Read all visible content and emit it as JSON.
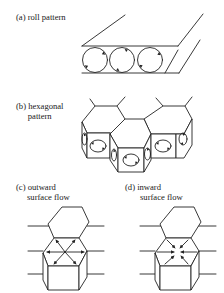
{
  "figure": {
    "panels": [
      {
        "id": "a",
        "label_line1": "(a) roll pattern",
        "label_line2": ""
      },
      {
        "id": "b",
        "label_line1": "(b) hexagonal",
        "label_line2": "pattern"
      },
      {
        "id": "c",
        "label_line1": "(c) outward",
        "label_line2": "surface flow"
      },
      {
        "id": "d",
        "label_line1": "(d) inward",
        "label_line2": "surface flow"
      }
    ],
    "colors": {
      "stroke": "#222222",
      "background": "#ffffff"
    },
    "roll_count": 3,
    "icons": {
      "roll_cells": "circulating-roll-icon",
      "hex_cells": "hexagonal-cell-icon",
      "outward_arrows": "outward-arrows-icon",
      "inward_arrows": "inward-arrows-icon"
    }
  }
}
